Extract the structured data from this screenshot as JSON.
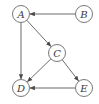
{
  "diagram": {
    "type": "directed-graph",
    "nodes": [
      {
        "id": "A",
        "label": "A",
        "x": 21,
        "y": 14
      },
      {
        "id": "B",
        "label": "B",
        "x": 84,
        "y": 14
      },
      {
        "id": "C",
        "label": "C",
        "x": 57,
        "y": 53
      },
      {
        "id": "D",
        "label": "D",
        "x": 21,
        "y": 88
      },
      {
        "id": "E",
        "label": "E",
        "x": 84,
        "y": 88
      }
    ],
    "edges": [
      {
        "from": "B",
        "to": "A"
      },
      {
        "from": "A",
        "to": "C"
      },
      {
        "from": "A",
        "to": "D"
      },
      {
        "from": "C",
        "to": "D"
      },
      {
        "from": "C",
        "to": "E"
      },
      {
        "from": "E",
        "to": "D"
      }
    ],
    "colors": {
      "stroke": "#6a6a6a",
      "text": "#3a3a3a",
      "background": "#ffffff"
    }
  }
}
